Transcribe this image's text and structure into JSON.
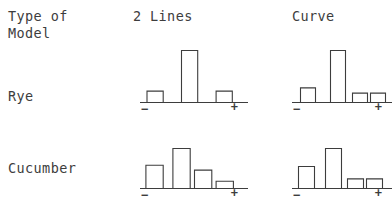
{
  "figure": {
    "corner_label": "Type of\nModel",
    "column_headers": [
      "2 Lines",
      "Curve"
    ],
    "row_labels": [
      "Rye",
      "Cucumber"
    ],
    "axis_min_symbol": "−",
    "axis_max_symbol": "+",
    "stroke_color": "#3d3d3d",
    "background_color": "#ffffff"
  },
  "chart_data": {
    "type": "bar",
    "title": "Type of Model",
    "xlabel": "",
    "ylabel": "",
    "grid": false,
    "legend": "none",
    "note": "2x2 grid of small histograms. Rows = species (Rye, Cucumber). Columns = model type (2 Lines, Curve). Each panel's x-axis runs from - (minus) to + (plus); bars are unfilled outlines. Values are relative frequencies estimated from bar heights (0-1 scale).",
    "xlim": [
      0,
      1
    ],
    "ylim": [
      0,
      1
    ],
    "panels": [
      {
        "row": "Rye",
        "column": "2 Lines",
        "xlabel_left": "−",
        "xlabel_right": "+",
        "categories": [
          "b1",
          "b2",
          "b3"
        ],
        "values": [
          0.22,
          1.0,
          0.22
        ],
        "bar_positions": [
          0.06,
          0.38,
          0.7
        ],
        "bar_width": 0.15
      },
      {
        "row": "Rye",
        "column": "Curve",
        "xlabel_left": "−",
        "xlabel_right": "+",
        "categories": [
          "b1",
          "b2",
          "b3",
          "b4"
        ],
        "values": [
          0.28,
          1.0,
          0.18,
          0.18
        ],
        "bar_positions": [
          0.08,
          0.38,
          0.6,
          0.78
        ],
        "bar_width": 0.15
      },
      {
        "row": "Cucumber",
        "column": "2 Lines",
        "xlabel_left": "−",
        "xlabel_right": "+",
        "categories": [
          "b1",
          "b2",
          "b3",
          "b4"
        ],
        "values": [
          0.58,
          1.0,
          0.46,
          0.18
        ],
        "bar_positions": [
          0.05,
          0.3,
          0.5,
          0.7
        ],
        "bar_width": 0.16
      },
      {
        "row": "Cucumber",
        "column": "Curve",
        "xlabel_left": "−",
        "xlabel_right": "+",
        "categories": [
          "b1",
          "b2",
          "b3",
          "b4"
        ],
        "values": [
          0.55,
          1.0,
          0.24,
          0.24
        ],
        "bar_positions": [
          0.06,
          0.33,
          0.55,
          0.74
        ],
        "bar_width": 0.16
      }
    ]
  }
}
